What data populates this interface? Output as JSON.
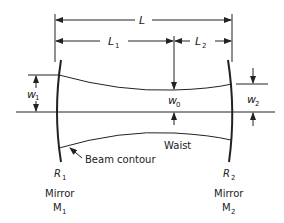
{
  "diagram": {
    "labels": {
      "L": "L",
      "L1": "L",
      "L1_sub": "1",
      "L2": "L",
      "L2_sub": "2",
      "w1": "w",
      "w1_sub": "1",
      "w0": "w",
      "w0_sub": "0",
      "w2": "w",
      "w2_sub": "2",
      "R1": "R",
      "R1_sub": "1",
      "R2": "R",
      "R2_sub": "2",
      "waist": "Waist",
      "beam_contour": "Beam contour",
      "mirror1_line1": "Mirror",
      "mirror1_line2": "M",
      "mirror1_sub": "1",
      "mirror2_line1": "Mirror",
      "mirror2_line2": "M",
      "mirror2_sub": "2"
    },
    "colors": {
      "ink": "#222222",
      "background": "#ffffff"
    }
  }
}
